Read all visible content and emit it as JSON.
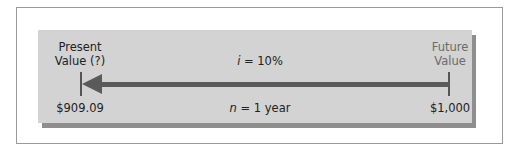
{
  "diagram": {
    "present_label_line1": "Present",
    "present_label_line2": "Value (?)",
    "present_value": "$909.09",
    "future_label_line1": "Future",
    "future_label_line2": "Value",
    "future_value": "$1,000",
    "rate_var": "i",
    "rate_text": " = 10%",
    "period_var": "n",
    "period_text": " = 1 year",
    "arrow_direction": "left"
  }
}
